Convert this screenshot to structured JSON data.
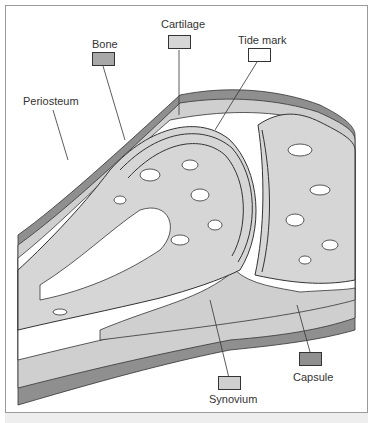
{
  "diagram": {
    "type": "anatomical joint cross-section",
    "colors": {
      "bone": "#a8a8a8",
      "cartilage": "#d6d6d6",
      "tide_mark": "#ffffff",
      "synovium": "#cfcfcf",
      "capsule": "#8f8f8f",
      "marrow": "#ffffff",
      "outline": "#333333"
    },
    "labels": {
      "bone": "Bone",
      "cartilage": "Cartilage",
      "tide_mark": "Tide mark",
      "periosteum": "Periosteum",
      "synovium": "Synovium",
      "capsule": "Capsule"
    }
  }
}
